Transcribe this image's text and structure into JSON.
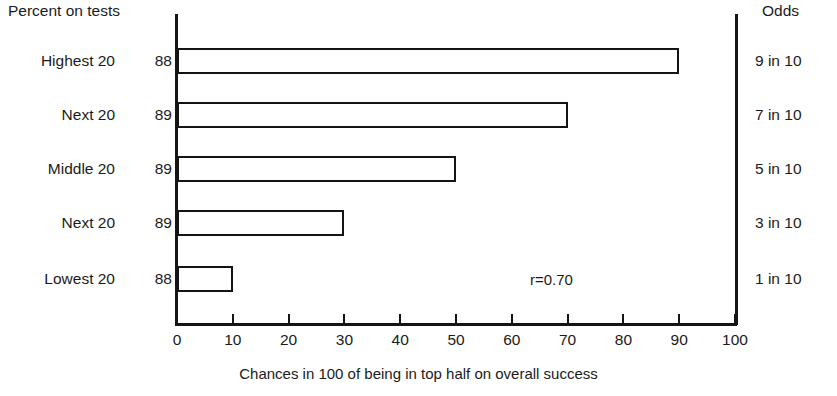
{
  "headers": {
    "left": "Percent on tests",
    "right": "Odds"
  },
  "axis_titles": {
    "y": "Number of persons",
    "x": "Chances in 100 of being in top half on overall success"
  },
  "annotation": "r=0.70",
  "rows": [
    {
      "category": "Highest 20",
      "n": "88",
      "value": 90,
      "odds": "9 in 10"
    },
    {
      "category": "Next 20",
      "n": "89",
      "value": 70,
      "odds": "7 in 10"
    },
    {
      "category": "Middle 20",
      "n": "89",
      "value": 50,
      "odds": "5 in 10"
    },
    {
      "category": "Next 20",
      "n": "89",
      "value": 30,
      "odds": "3 in 10"
    },
    {
      "category": "Lowest 20",
      "n": "88",
      "value": 10,
      "odds": "1 in 10"
    }
  ],
  "x_ticks": [
    "0",
    "10",
    "20",
    "30",
    "40",
    "50",
    "60",
    "70",
    "80",
    "90",
    "100"
  ],
  "colors": {
    "ink": "#141414",
    "background": "#ffffff"
  },
  "chart_data": {
    "type": "bar",
    "orientation": "horizontal",
    "title": "",
    "subtitle": "",
    "xlabel": "Chances in 100 of being in top half on overall success",
    "ylabel": "Number of persons",
    "categories": [
      "Highest 20",
      "Next 20",
      "Middle 20",
      "Next 20",
      "Lowest 20"
    ],
    "values": [
      90,
      70,
      50,
      30,
      10
    ],
    "xlim": [
      0,
      100
    ],
    "xticks": [
      0,
      10,
      20,
      30,
      40,
      50,
      60,
      70,
      80,
      90,
      100
    ],
    "grid": false,
    "legend": null,
    "annotations": [
      "r=0.70"
    ],
    "secondary_axis": {
      "label": "Odds",
      "tick_labels": [
        "9 in 10",
        "7 in 10",
        "5 in 10",
        "3 in 10",
        "1 in 10"
      ]
    },
    "group_header_left": "Percent on tests",
    "group_counts_label": "Number of persons",
    "group_counts": [
      88,
      89,
      89,
      89,
      88
    ],
    "bar_style": "outlined-open",
    "bar_fill": "#ffffff",
    "bar_edge": "#141414"
  }
}
